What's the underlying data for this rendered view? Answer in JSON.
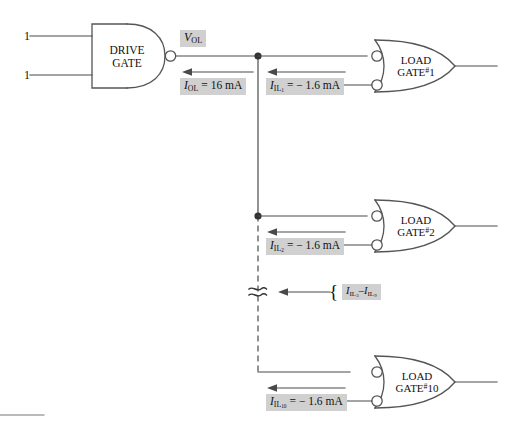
{
  "diagram": {
    "colors": {
      "line": "#4a4a4a",
      "gate_stroke": "#555555",
      "label_bg": "#d0d0d0",
      "text": "#111111",
      "background": "#ffffff"
    },
    "drive_gate": {
      "name": "DRIVE GATE",
      "line1": "DRIVE",
      "line2": "GATE",
      "type": "nand-gate",
      "inputs": [
        {
          "label": "1"
        },
        {
          "label": "1"
        }
      ]
    },
    "output_labels": {
      "voltage": {
        "symbol": "V",
        "subscript": "OL",
        "text": "V_OL"
      },
      "current": {
        "symbol": "I",
        "subscript": "OL",
        "value": "= 16 mA",
        "text": "I_OL = 16 mA"
      }
    },
    "load_gates": [
      {
        "id": "load-gate-1",
        "line1": "LOAD",
        "line2": "GATE",
        "number": "1",
        "number_prefix": "#",
        "current": {
          "symbol": "I",
          "subscript": "IL",
          "index": "1",
          "value": "= − 1.6 mA",
          "text": "I_IL1 = -1.6 mA"
        }
      },
      {
        "id": "load-gate-2",
        "line1": "LOAD",
        "line2": "GATE",
        "number": "2",
        "number_prefix": "#",
        "current": {
          "symbol": "I",
          "subscript": "IL",
          "index": "2",
          "value": "= − 1.6 mA",
          "text": "I_IL2 = -1.6 mA"
        }
      },
      {
        "id": "load-gate-10",
        "line1": "LOAD",
        "line2": "GATE",
        "number": "10",
        "number_prefix": "#",
        "current": {
          "symbol": "I",
          "subscript": "IL",
          "index": "10",
          "value": "= − 1.6 mA",
          "text": "I_IL10 = -1.6 mA"
        }
      }
    ],
    "break_annotation": {
      "brace": "{",
      "symbol": "I",
      "subscript": "IL",
      "index_from": "3",
      "index_to": "9",
      "separator": "–",
      "text": "I_IL3 - I_IL9",
      "break_symbol": "≈"
    }
  }
}
